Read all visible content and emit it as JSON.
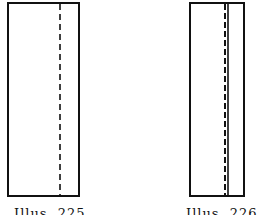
{
  "figures": [
    {
      "caption": "Illus. 225",
      "rect": {
        "x": 8,
        "y": 3,
        "w": 71,
        "h": 193
      },
      "dashed_line_x": 60,
      "solid_line_x": null
    },
    {
      "caption": "Illus. 226",
      "rect": {
        "x": 190,
        "y": 3,
        "w": 54,
        "h": 193
      },
      "dashed_line_x": 225,
      "solid_line_x": 227
    }
  ],
  "colors": {
    "stroke": "#111111",
    "background": "#ffffff"
  }
}
